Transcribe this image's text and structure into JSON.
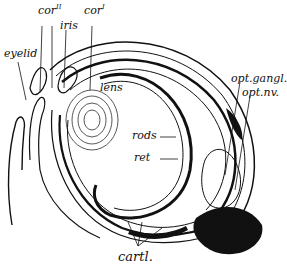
{
  "figure": {
    "labels": {
      "cor2": "cor",
      "cor2_sup": "II",
      "cor1": "cor",
      "cor1_sup": "I",
      "iris": "iris",
      "eyelid": "eyelid",
      "lens": "lens",
      "rods": "rods",
      "ret": "ret",
      "opt_gangl": "opt.gangl.",
      "opt_nv": "opt.nv.",
      "cartl": "cartl."
    },
    "colors": {
      "ink": "#111111",
      "background": "#ffffff"
    }
  }
}
